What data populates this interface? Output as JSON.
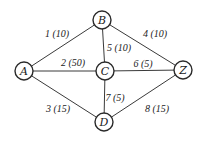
{
  "diagram": {
    "type": "weighted-graph",
    "nodes": [
      {
        "id": "A",
        "label": "A",
        "x": 24,
        "y": 71
      },
      {
        "id": "B",
        "label": "B",
        "x": 102,
        "y": 20
      },
      {
        "id": "C",
        "label": "C",
        "x": 105,
        "y": 71
      },
      {
        "id": "Z",
        "label": "Z",
        "x": 183,
        "y": 70
      },
      {
        "id": "D",
        "label": "D",
        "x": 104,
        "y": 122
      }
    ],
    "edges": [
      {
        "from": "A",
        "to": "B",
        "label": "1 (10)",
        "lx": 57,
        "ly": 33
      },
      {
        "from": "A",
        "to": "C",
        "label": "2 (50)",
        "lx": 73,
        "ly": 62
      },
      {
        "from": "A",
        "to": "D",
        "label": "3 (15)",
        "lx": 58,
        "ly": 108
      },
      {
        "from": "B",
        "to": "Z",
        "label": "4 (10)",
        "lx": 155,
        "ly": 33
      },
      {
        "from": "B",
        "to": "C",
        "label": "5 (10)",
        "lx": 119,
        "ly": 47
      },
      {
        "from": "C",
        "to": "Z",
        "label": "6 (5)",
        "lx": 143,
        "ly": 63
      },
      {
        "from": "C",
        "to": "D",
        "label": "7 (5)",
        "lx": 115,
        "ly": 97
      },
      {
        "from": "D",
        "to": "Z",
        "label": "8 (15)",
        "lx": 157,
        "ly": 108
      }
    ],
    "node_radius": 9
  }
}
